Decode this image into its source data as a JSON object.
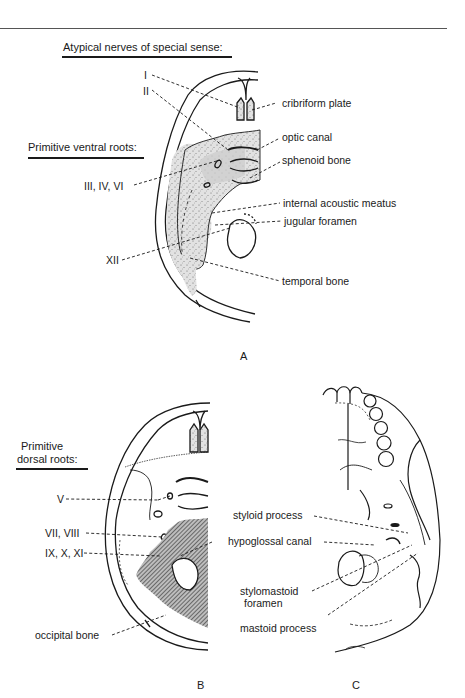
{
  "figure": {
    "panels": [
      {
        "id": "A",
        "letter": "A",
        "heading_top": "Atypical nerves of special sense:",
        "heading_left": "Primitive ventral roots:",
        "nerve_labels": [
          "I",
          "II",
          "III, IV, VI",
          "XII"
        ],
        "structure_labels": [
          "cribriform plate",
          "optic canal",
          "sphenoid bone",
          "internal acoustic meatus",
          "jugular foramen",
          "temporal bone"
        ]
      },
      {
        "id": "B",
        "letter": "B",
        "heading_line1": "Primitive",
        "heading_line2": "dorsal roots:",
        "nerve_labels": [
          "V",
          "VII, VIII",
          "IX, X, XI"
        ],
        "structure_labels": [
          "occipital bone"
        ]
      },
      {
        "id": "C",
        "letter": "C",
        "structure_labels": [
          "styloid process",
          "hypoglossal canal",
          "stylomastoid",
          "foramen",
          "mastoid process"
        ]
      }
    ],
    "colors": {
      "ink": "#1a1a1a",
      "stipple_fill": "#d9d9d9",
      "hatch_fill": "#6b6b6b",
      "background": "#ffffff"
    }
  }
}
